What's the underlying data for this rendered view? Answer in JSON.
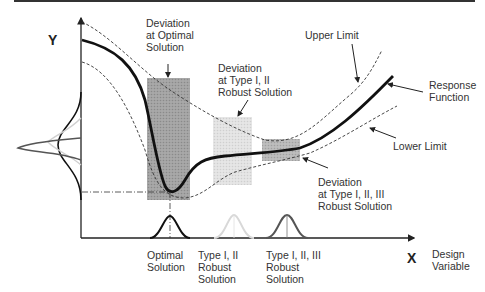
{
  "figure": {
    "top_rule": true,
    "axes": {
      "y_label": "Y",
      "x_label": "X",
      "x_caption": "Design\nVariable"
    },
    "annotations": {
      "deviation_optimal": "Deviation\nat Optimal\nSolution",
      "deviation_type12": "Deviation\nat Type I, II\nRobust Solution",
      "deviation_type123": "Deviation\nat Type I, II, III\nRobust Solution",
      "upper_limit": "Upper Limit",
      "lower_limit": "Lower Limit",
      "response_function": "Response\nFunction"
    },
    "solutions": [
      {
        "label": "Optimal\nSolution",
        "shade": "#9a9a9a"
      },
      {
        "label": "Type I, II\nRobust\nSolution",
        "shade": "#dcdcdc"
      },
      {
        "label": "Type I, II, III\nRobust\nSolution",
        "shade": "#b4b4b4"
      }
    ],
    "colors": {
      "response_curve": "#111111",
      "limits": "#333333",
      "optimal_box": "#9a9a9a",
      "type12_box": "#dcdcdc",
      "type123_box": "#b4b4b4"
    }
  }
}
